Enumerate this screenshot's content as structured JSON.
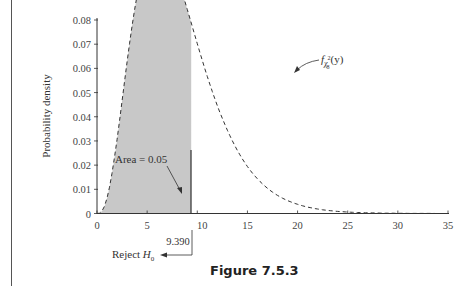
{
  "chart_data": {
    "type": "line",
    "title": "",
    "xlabel": "",
    "ylabel": "Probability density",
    "xlim": [
      0,
      35
    ],
    "ylim": [
      0,
      0.08
    ],
    "x_ticks": [
      0,
      5,
      10,
      15,
      20,
      25,
      30,
      35
    ],
    "y_ticks": [
      0,
      0.01,
      0.02,
      0.03,
      0.04,
      0.05,
      0.06,
      0.07,
      0.08
    ],
    "y_tick_labels": [
      "0",
      "0.01",
      "0.02",
      "0.03",
      "0.04",
      "0.05",
      "0.06",
      "0.07",
      "0.08"
    ],
    "grid": false,
    "series": [
      {
        "name": "chi-square density, 8 degrees of freedom",
        "style": "dashed",
        "x": [
          0,
          2,
          4,
          5,
          6,
          8,
          9.39,
          10,
          12,
          14,
          16,
          18,
          20,
          22,
          24,
          26,
          28,
          30,
          32,
          35
        ],
        "values": [
          0,
          0.0001,
          0.001,
          0.0028,
          0.006,
          0.0155,
          0.0262,
          0.03,
          0.048,
          0.062,
          0.07,
          0.069,
          0.063,
          0.053,
          0.043,
          0.033,
          0.024,
          0.017,
          0.012,
          0.006
        ]
      }
    ],
    "shaded_region": {
      "from": 0,
      "to": 9.39,
      "area": 0.05
    },
    "annotations": {
      "curve_label": "f",
      "curve_label_sub": "χ",
      "curve_label_subsup": "2",
      "curve_label_subsub": "8",
      "curve_label_arg": "(y)",
      "area_label": "Area = 0.05",
      "critical_value": "9.390",
      "reject_label": "Reject ",
      "reject_h": "H",
      "reject_h_sub": "0"
    }
  },
  "caption": "Figure 7.5.3"
}
